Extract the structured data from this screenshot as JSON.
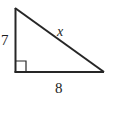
{
  "figure": {
    "type": "right-triangle-diagram",
    "background_color": "#ffffff",
    "stroke_color": "#262626",
    "text_color": "#1d1d1d",
    "vertices": {
      "top": {
        "x": 15,
        "y": 8
      },
      "bottom_left": {
        "x": 15,
        "y": 72
      },
      "bottom_right": {
        "x": 104,
        "y": 72
      }
    },
    "sides": [
      {
        "name": "vertical-leg",
        "label": "7",
        "from": "top",
        "to": "bottom_left",
        "stroke_width": 2
      },
      {
        "name": "horizontal-leg",
        "label": "8",
        "from": "bottom_left",
        "to": "bottom_right",
        "stroke_width": 2
      },
      {
        "name": "hypotenuse",
        "label": "x",
        "from": "top",
        "to": "bottom_right",
        "stroke_width": 2
      }
    ],
    "right_angle_marker": {
      "name": "right-angle-square",
      "at_vertex": "bottom_left",
      "size": 11,
      "stroke_width": 1.2
    },
    "labels": {
      "vertical_leg": "7",
      "hypotenuse": "x",
      "horizontal_leg": "8"
    }
  }
}
